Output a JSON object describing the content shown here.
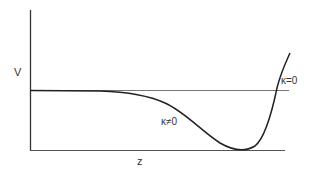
{
  "diagram": {
    "y_axis_label": "V",
    "x_axis_label": "z",
    "curves": [
      {
        "name": "kappa-zero",
        "label": "κ=0",
        "description": "horizontal constant potential line"
      },
      {
        "name": "kappa-nonzero",
        "label": "κ≠0",
        "description": "potential dipping to a minimum then rising sharply"
      }
    ],
    "colors": {
      "axis": "#333333",
      "flat_line": "#777777",
      "curve": "#222222"
    }
  }
}
